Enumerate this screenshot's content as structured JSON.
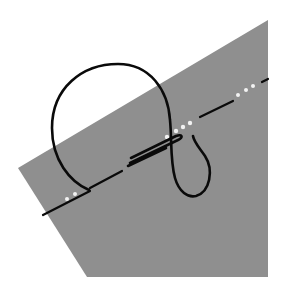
{
  "diagram": {
    "type": "knot-illustration",
    "colors": {
      "background": "#ffffff",
      "plane": "#8f8f8f",
      "rope": "#0a0a0a",
      "dots": "#f2f2f2"
    },
    "plane_points": "18,168 268,20 268,277 87,277",
    "elements": [
      "gray-plane",
      "dashed-stitch-line",
      "rope-loop",
      "hidden-stitch-dots"
    ]
  }
}
